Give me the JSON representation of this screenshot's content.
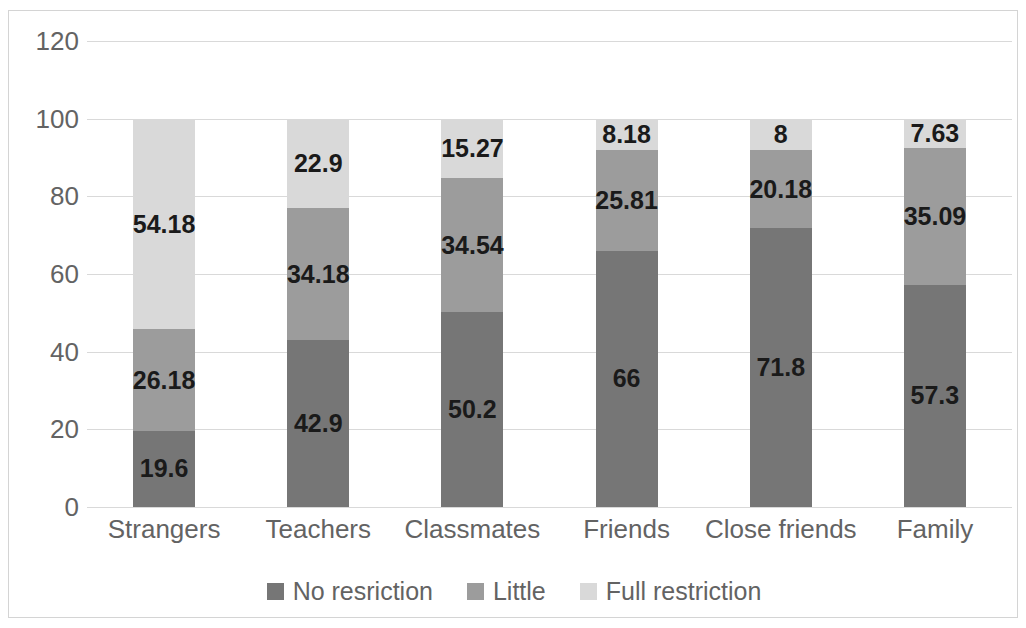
{
  "chart_data": {
    "type": "bar",
    "stacked": true,
    "orientation": "vertical",
    "title": "",
    "subtitle": "",
    "xlabel": "",
    "ylabel": "",
    "ylim": [
      0,
      120
    ],
    "ytick_values": [
      0,
      20,
      40,
      60,
      80,
      100,
      120
    ],
    "ytick_labels": [
      "0",
      "20",
      "40",
      "60",
      "80",
      "100",
      "120"
    ],
    "grid": "horizontal",
    "legend_position": "bottom-center",
    "categories": [
      "Strangers",
      "Teachers",
      "Classmates",
      "Friends",
      "Close friends",
      "Family"
    ],
    "series": [
      {
        "name": "No resriction",
        "color": "#767676",
        "values": [
          19.6,
          42.9,
          50.2,
          66,
          71.8,
          57.3
        ],
        "labels": [
          "19.6",
          "42.9",
          "50.2",
          "66",
          "71.8",
          "57.3"
        ]
      },
      {
        "name": "Little",
        "color": "#9c9c9c",
        "values": [
          26.18,
          34.18,
          34.54,
          25.81,
          20.18,
          35.09
        ],
        "labels": [
          "26.18",
          "34.18",
          "34.54",
          "25.81",
          "20.18",
          "35.09"
        ]
      },
      {
        "name": "Full restriction",
        "color": "#d9d9d9",
        "values": [
          54.18,
          22.9,
          15.27,
          8.18,
          8,
          7.63
        ],
        "labels": [
          "54.18",
          "22.9",
          "15.27",
          "8.18",
          "8",
          "7.63"
        ]
      }
    ]
  },
  "style": {
    "gridline_color": "#d9d9d9",
    "frame_color": "#d4d4d4",
    "axis_text_color": "#636363",
    "data_label_color": "#1a1a1a",
    "background": "#ffffff"
  }
}
